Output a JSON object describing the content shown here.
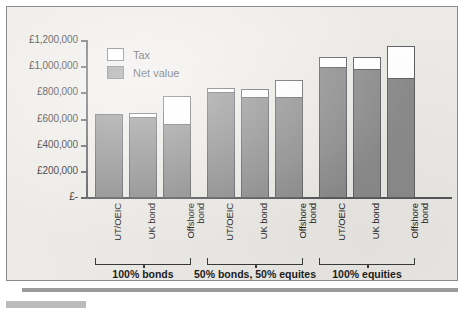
{
  "figure": {
    "background_color": "#eceae6",
    "border_color": "#8c8c8c"
  },
  "legend": {
    "position": "inside-top-left",
    "items": [
      {
        "label": "Tax",
        "swatch": "white-swatch",
        "color": "#ffffff"
      },
      {
        "label": "Net value",
        "swatch": "gray-swatch",
        "color": "#8b8b8b"
      }
    ]
  },
  "y_axis": {
    "ticks": [
      {
        "label": "£1,200,000",
        "value": 1200000
      },
      {
        "label": "£1,000,000",
        "value": 1000000
      },
      {
        "label": "£800,000",
        "value": 800000
      },
      {
        "label": "£600,000",
        "value": 600000
      },
      {
        "label": "£400,000",
        "value": 400000
      },
      {
        "label": "£200,000",
        "value": 200000
      },
      {
        "label": "£-",
        "value": 0
      }
    ]
  },
  "groups": [
    {
      "label": "100% bonds"
    },
    {
      "label": "50% bonds, 50% equites"
    },
    {
      "label": "100% equities"
    }
  ],
  "chart_data": {
    "type": "bar",
    "subtype": "stacked",
    "title": "",
    "xlabel": "",
    "ylabel": "",
    "ylim": [
      0,
      1200000
    ],
    "ytick_step": 200000,
    "currency": "GBP",
    "grid": false,
    "legend_position": "inside-top-left",
    "categories": [
      "UT/OEIC",
      "UK bond",
      "Offshore bond",
      "UT/OEIC",
      "UK bond",
      "Offshore bond",
      "UT/OEIC",
      "UK bond",
      "Offshore bond"
    ],
    "groups": [
      "100% bonds",
      "50% bonds, 50% equites",
      "100% equities"
    ],
    "group_spans": [
      [
        0,
        2
      ],
      [
        3,
        5
      ],
      [
        6,
        8
      ]
    ],
    "series": [
      {
        "name": "Net value",
        "color": "#8b8b8b",
        "values": [
          640000,
          620000,
          565000,
          810000,
          775000,
          770000,
          1000000,
          985000,
          920000
        ]
      },
      {
        "name": "Tax",
        "color": "#ffffff",
        "values": [
          0,
          30000,
          215000,
          30000,
          60000,
          130000,
          80000,
          95000,
          240000
        ]
      }
    ],
    "totals": [
      640000,
      650000,
      780000,
      840000,
      835000,
      900000,
      1080000,
      1080000,
      1160000
    ]
  }
}
